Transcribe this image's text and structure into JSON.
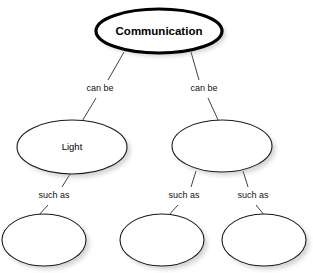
{
  "diagram": {
    "type": "concept-map",
    "title_node": "Communication",
    "background_color": "#ffffff",
    "node_fill": "#ffffff",
    "node_stroke": "#1a1a1a",
    "root_stroke": "#000000",
    "text_color": "#000000",
    "nodes": [
      {
        "id": "root",
        "label": "Communication",
        "cx": 159,
        "cy": 31,
        "rx": 63,
        "ry": 22,
        "emphasis": "root",
        "empty": false
      },
      {
        "id": "light",
        "label": "Light",
        "cx": 72,
        "cy": 147,
        "rx": 55,
        "ry": 27,
        "emphasis": "plain",
        "empty": false
      },
      {
        "id": "right-mid",
        "label": "",
        "cx": 222,
        "cy": 146,
        "rx": 50,
        "ry": 26,
        "emphasis": "plain",
        "empty": true
      },
      {
        "id": "leaf-1",
        "label": "",
        "cx": 44,
        "cy": 240,
        "rx": 42,
        "ry": 26,
        "emphasis": "plain",
        "empty": true
      },
      {
        "id": "leaf-2",
        "label": "",
        "cx": 162,
        "cy": 240,
        "rx": 42,
        "ry": 26,
        "emphasis": "plain",
        "empty": true
      },
      {
        "id": "leaf-3",
        "label": "",
        "cx": 264,
        "cy": 240,
        "rx": 42,
        "ry": 26,
        "emphasis": "plain",
        "empty": true
      }
    ],
    "links": [
      {
        "id": "root-to-light",
        "label": "can be",
        "from": "root",
        "to": "light",
        "label_x": 100,
        "label_y": 89,
        "upper": {
          "x1": 124,
          "y1": 52,
          "x2": 108,
          "y2": 80
        },
        "lower": {
          "x1": 96,
          "y1": 98,
          "x2": 81,
          "y2": 123
        }
      },
      {
        "id": "root-to-rightmid",
        "label": "can be",
        "from": "root",
        "to": "right-mid",
        "label_x": 204,
        "label_y": 89,
        "upper": {
          "x1": 191,
          "y1": 52,
          "x2": 199,
          "y2": 80
        },
        "lower": {
          "x1": 208,
          "y1": 98,
          "x2": 219,
          "y2": 122
        }
      },
      {
        "id": "light-to-leaf1",
        "label": "such as",
        "from": "light",
        "to": "leaf-1",
        "label_x": 54,
        "label_y": 196,
        "upper": {
          "x1": 70,
          "y1": 174,
          "x2": 62,
          "y2": 187
        },
        "lower": {
          "x1": 48,
          "y1": 205,
          "x2": 38,
          "y2": 216
        }
      },
      {
        "id": "rightmid-to-leaf2",
        "label": "such as",
        "from": "right-mid",
        "to": "leaf-2",
        "label_x": 184,
        "label_y": 196,
        "upper": {
          "x1": 196,
          "y1": 171,
          "x2": 191,
          "y2": 187
        },
        "lower": {
          "x1": 178,
          "y1": 205,
          "x2": 168,
          "y2": 216
        }
      },
      {
        "id": "rightmid-to-leaf3",
        "label": "such as",
        "from": "right-mid",
        "to": "leaf-3",
        "label_x": 253,
        "label_y": 196,
        "upper": {
          "x1": 243,
          "y1": 171,
          "x2": 248,
          "y2": 187
        },
        "lower": {
          "x1": 256,
          "y1": 205,
          "x2": 265,
          "y2": 216
        }
      }
    ]
  }
}
